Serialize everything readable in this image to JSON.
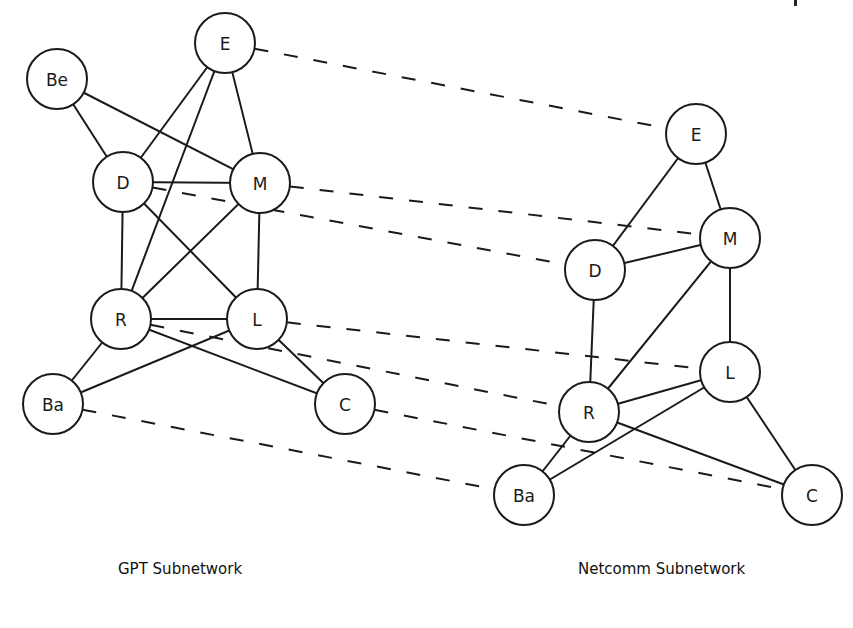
{
  "colors": {
    "stroke": "#1a1a1a",
    "background": "#ffffff"
  },
  "captions": {
    "left": "GPT Subnetwork",
    "right": "Netcomm Subnetwork"
  },
  "node_radius": 30,
  "subnetworks": [
    {
      "id": "gpt",
      "name": "GPT Subnetwork",
      "nodes": [
        {
          "id": "E",
          "label": "E",
          "x": 225,
          "y": 43
        },
        {
          "id": "Be",
          "label": "Be",
          "x": 57,
          "y": 79
        },
        {
          "id": "D",
          "label": "D",
          "x": 123,
          "y": 182
        },
        {
          "id": "M",
          "label": "M",
          "x": 260,
          "y": 183
        },
        {
          "id": "R",
          "label": "R",
          "x": 121,
          "y": 319
        },
        {
          "id": "L",
          "label": "L",
          "x": 257,
          "y": 319
        },
        {
          "id": "Ba",
          "label": "Ba",
          "x": 53,
          "y": 404
        },
        {
          "id": "C",
          "label": "C",
          "x": 345,
          "y": 404
        }
      ],
      "edges": [
        [
          "Be",
          "D"
        ],
        [
          "Be",
          "M"
        ],
        [
          "E",
          "D"
        ],
        [
          "E",
          "R"
        ],
        [
          "E",
          "M"
        ],
        [
          "D",
          "M"
        ],
        [
          "D",
          "R"
        ],
        [
          "D",
          "L"
        ],
        [
          "M",
          "R"
        ],
        [
          "M",
          "L"
        ],
        [
          "R",
          "L"
        ],
        [
          "R",
          "Ba"
        ],
        [
          "R",
          "C"
        ],
        [
          "L",
          "Ba"
        ],
        [
          "L",
          "C"
        ]
      ]
    },
    {
      "id": "netcomm",
      "name": "Netcomm Subnetwork",
      "nodes": [
        {
          "id": "E",
          "label": "E",
          "x": 696,
          "y": 134
        },
        {
          "id": "M",
          "label": "M",
          "x": 730,
          "y": 238
        },
        {
          "id": "D",
          "label": "D",
          "x": 595,
          "y": 270
        },
        {
          "id": "L",
          "label": "L",
          "x": 730,
          "y": 372
        },
        {
          "id": "R",
          "label": "R",
          "x": 589,
          "y": 412
        },
        {
          "id": "Ba",
          "label": "Ba",
          "x": 524,
          "y": 495
        },
        {
          "id": "C",
          "label": "C",
          "x": 812,
          "y": 495
        }
      ],
      "edges": [
        [
          "E",
          "D"
        ],
        [
          "E",
          "M"
        ],
        [
          "D",
          "M"
        ],
        [
          "D",
          "R"
        ],
        [
          "M",
          "R"
        ],
        [
          "M",
          "L"
        ],
        [
          "R",
          "L"
        ],
        [
          "R",
          "Ba"
        ],
        [
          "R",
          "C"
        ],
        [
          "L",
          "Ba"
        ],
        [
          "L",
          "C"
        ]
      ]
    }
  ],
  "correspondences": [
    [
      "E",
      "E"
    ],
    [
      "M",
      "M"
    ],
    [
      "D",
      "D"
    ],
    [
      "L",
      "L"
    ],
    [
      "R",
      "R"
    ],
    [
      "C",
      "C"
    ],
    [
      "Ba",
      "Ba"
    ]
  ]
}
